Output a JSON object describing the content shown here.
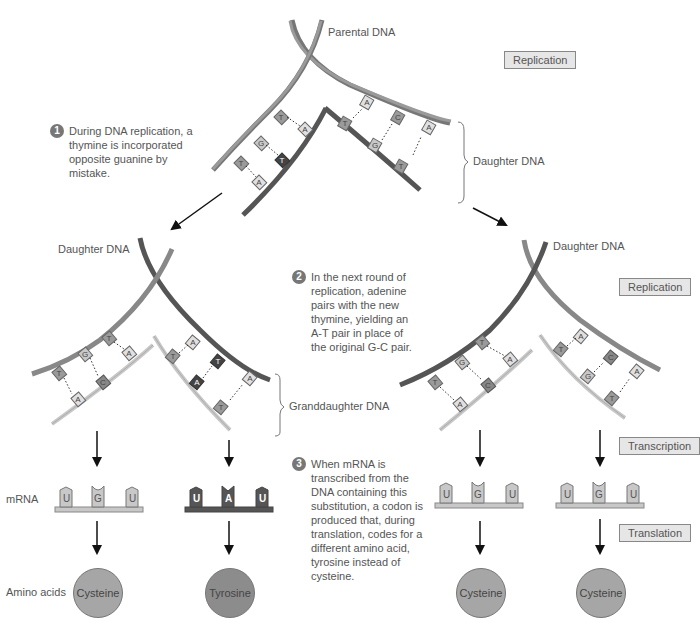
{
  "labels": {
    "parental_dna": "Parental DNA",
    "daughter_dna_top": "Daughter DNA",
    "daughter_dna_left": "Daughter DNA",
    "daughter_dna_right": "Daughter DNA",
    "granddaughter_dna": "Granddaughter DNA",
    "mrna": "mRNA",
    "amino_acids": "Amino acids"
  },
  "process_boxes": {
    "replication_top": "Replication",
    "replication_right": "Replication",
    "transcription": "Transcription",
    "translation": "Translation"
  },
  "steps": [
    {
      "num": "1",
      "text": "During DNA replication, a thymine is incorporated opposite guanine by mistake."
    },
    {
      "num": "2",
      "text": "In the next round of replication, adenine pairs with the new thymine, yielding an A-T pair in place of the original G-C pair."
    },
    {
      "num": "3",
      "text": "When mRNA is transcribed from the DNA containing this substitution, a codon is produced that, during translation, codes for a different amino acid, tyrosine instead of cysteine."
    }
  ],
  "mrna_codons": [
    {
      "bases": [
        "U",
        "G",
        "U"
      ],
      "style": "light"
    },
    {
      "bases": [
        "U",
        "A",
        "U"
      ],
      "style": "dark"
    },
    {
      "bases": [
        "U",
        "G",
        "U"
      ],
      "style": "light"
    },
    {
      "bases": [
        "U",
        "G",
        "U"
      ],
      "style": "light"
    }
  ],
  "amino_acids": [
    {
      "name": "Cysteine",
      "style": "light"
    },
    {
      "name": "Tyrosine",
      "style": "dark"
    },
    {
      "name": "Cysteine",
      "style": "light"
    },
    {
      "name": "Cysteine",
      "style": "light"
    }
  ],
  "colors": {
    "parental_strand": "#8a8a8a",
    "daughter_strand_dark": "#5a5a5a",
    "granddaughter_strand_light": "#c8c8c8",
    "base_light": "#d8d8d8",
    "base_mid": "#9a9a9a",
    "base_dark": "#555555",
    "box_fill": "#e6e6e6"
  }
}
